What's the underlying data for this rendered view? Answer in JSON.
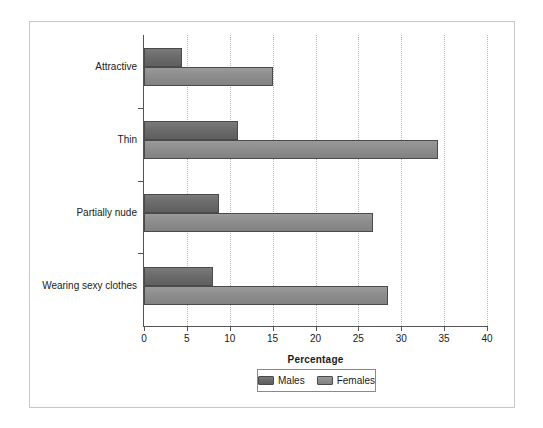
{
  "chart_data": {
    "type": "bar",
    "orientation": "horizontal",
    "title": "",
    "xlabel": "Percentage",
    "ylabel": "",
    "categories": [
      "Attractive",
      "Thin",
      "Partially nude",
      "Wearing sexy clothes"
    ],
    "series": [
      {
        "name": "Males",
        "values": [
          4.4,
          11.0,
          8.7,
          8.1
        ]
      },
      {
        "name": "Females",
        "values": [
          15.0,
          34.3,
          26.7,
          28.5
        ]
      }
    ],
    "xlim": [
      0,
      40
    ],
    "xticks": [
      0,
      5,
      10,
      15,
      20,
      25,
      30,
      35,
      40
    ],
    "xtick_labels": [
      "0",
      "5",
      "10",
      "15",
      "20",
      "25",
      "30",
      "35",
      "40"
    ],
    "grid": "vertical-dotted",
    "legend": {
      "position": "bottom-center",
      "entries": [
        "Males",
        "Females"
      ]
    },
    "colors": {
      "males": "#6b6b6b",
      "females": "#8d8d8d",
      "axis": "#555555",
      "grid": "#b4b4b4",
      "frame": "#c8c8c8"
    }
  }
}
